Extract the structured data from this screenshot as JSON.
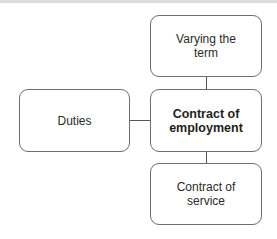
{
  "diagram": {
    "nodes": [
      {
        "id": "varying",
        "label_line1": "Varying the",
        "label_line2": "term"
      },
      {
        "id": "contract_employment",
        "label_line1": "Contract of",
        "label_line2": "employment"
      },
      {
        "id": "duties",
        "label_line1": "Duties",
        "label_line2": ""
      },
      {
        "id": "contract_service",
        "label_line1": "Contract of",
        "label_line2": "service"
      }
    ],
    "edges": [
      {
        "from": "varying",
        "to": "contract_employment"
      },
      {
        "from": "duties",
        "to": "contract_employment"
      },
      {
        "from": "contract_employment",
        "to": "contract_service"
      }
    ],
    "colors": {
      "border": "#6e6e6e",
      "line": "#555555",
      "text": "#2a2a2a"
    }
  }
}
